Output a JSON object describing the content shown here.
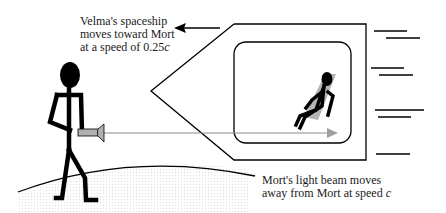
{
  "labels": {
    "velma": {
      "line1": "Velma's spaceship",
      "line2": "moves toward Mort",
      "line3_prefix": "at a speed of 0.25",
      "line3_italic": "c"
    },
    "beam": {
      "line1": "Mort's light beam moves",
      "line2_prefix": "away from Mort at speed ",
      "line2_italic": "c"
    }
  },
  "figures": {
    "mort": "stick-figure-holding-flashlight",
    "velma": "stick-figure-seated-in-spaceship-window"
  },
  "colors": {
    "ink": "#000000",
    "beam": "#8c8c8c",
    "beam_head": "#a0a0a0",
    "seat": "#b5b5b5",
    "ground_stipple": "#e6e6e6"
  }
}
